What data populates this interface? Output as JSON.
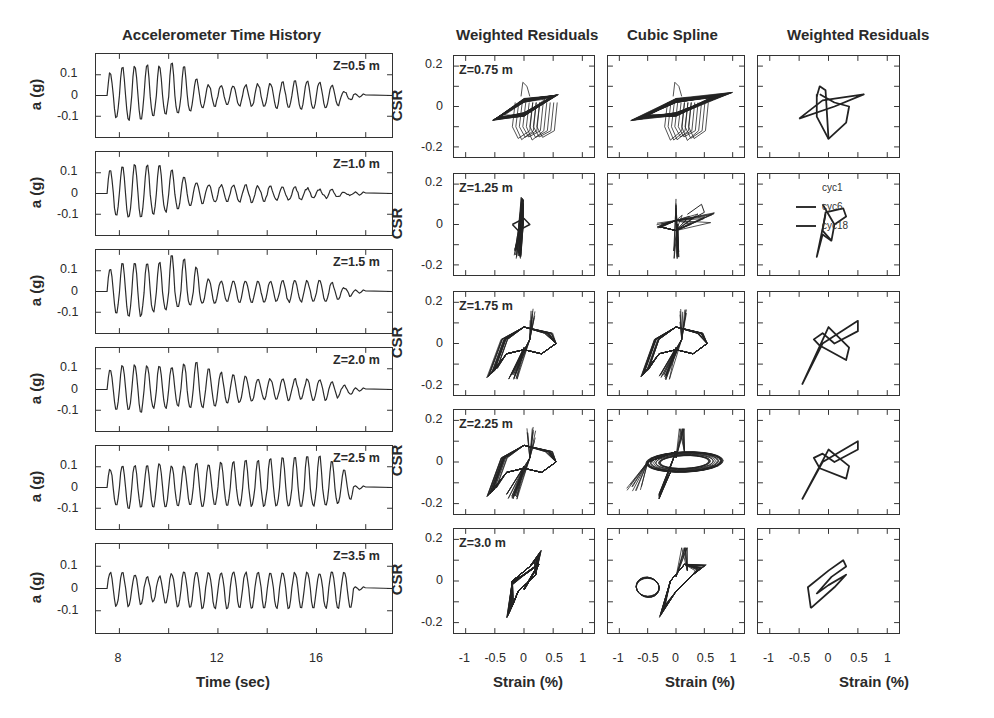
{
  "titles": {
    "accel": "Accelerometer Time History",
    "wr1": "Weighted Residuals",
    "cs": "Cubic Spline",
    "wr2": "Weighted Residuals"
  },
  "axes": {
    "accel_ylabel": "a (g)",
    "accel_xlabel": "Time (sec)",
    "accel_yticks": [
      "0.1",
      "0",
      "-0.1"
    ],
    "accel_xticks": [
      "8",
      "12",
      "16"
    ],
    "csr_ylabel": "CSR",
    "csr_yticks": [
      "0.2",
      "0",
      "-0.2"
    ],
    "csr_xlabel": "Strain (%)",
    "csr_xticks": [
      "-1",
      "-0.5",
      "0",
      "0.5",
      "1"
    ]
  },
  "accel_depths": [
    "Z=0.5 m",
    "Z=1.0 m",
    "Z=1.5 m",
    "Z=2.0 m",
    "Z=2.5 m",
    "Z=3.5 m"
  ],
  "csr_depths": [
    "Z=0.75 m",
    "Z=1.25 m",
    "Z=1.75 m",
    "Z=2.25 m",
    "Z=3.0 m"
  ],
  "legend": {
    "items": [
      "cyc1",
      "cyc6",
      "cyc18"
    ]
  },
  "chart_data": [
    {
      "type": "line",
      "title": "Accelerometer Time History",
      "xlabel": "Time (sec)",
      "ylabel": "a (g)",
      "xlim": [
        6,
        18
      ],
      "ylim": [
        -0.2,
        0.2
      ],
      "xticks": [
        8,
        12,
        16
      ],
      "yticks": [
        -0.1,
        0,
        0.1
      ],
      "series": [
        {
          "name": "Z=0.5 m",
          "description": "shaking ~7.5-18 s, peaks ~0.12 g early decaying to ~0.05 g, spikes to -0.17 g near 10-11 s"
        },
        {
          "name": "Z=1.0 m",
          "description": "peaks ~0.12 g early, decaying to ~0.03 g after 13 s, min ~-0.15 g"
        },
        {
          "name": "Z=1.5 m",
          "description": "peaks ~0.12 g, spikes to -0.18 g near 10.5-11.5 s, then ~0.05 g cycles"
        },
        {
          "name": "Z=2.0 m",
          "description": "peaks ~0.1 g, min ~-0.12 g, noisy mid-section 10-13 s"
        },
        {
          "name": "Z=2.5 m",
          "description": "peaks ~0.1 g, spikes to -0.15 g near 15-17 s"
        },
        {
          "name": "Z=3.5 m",
          "description": "uniform cycles ~+0.09/-0.07 g from 7.5 to 17.5 s"
        }
      ]
    },
    {
      "type": "line",
      "title": "Weighted Residuals",
      "xlabel": "Strain (%)",
      "ylabel": "CSR",
      "xlim": [
        -1.2,
        1.2
      ],
      "ylim": [
        -0.25,
        0.25
      ],
      "xticks": [
        -1,
        -0.5,
        0,
        0.5,
        1
      ],
      "yticks": [
        -0.2,
        0,
        0.2
      ],
      "series": [
        {
          "name": "Z=0.75 m",
          "description": "hysteresis loops, strain -0.5 to 0.6, CSR -0.17 to 0.1"
        },
        {
          "name": "Z=1.25 m",
          "description": "narrow loops, strain -0.2 to 0.1, CSR -0.17 to 0.12"
        },
        {
          "name": "Z=1.75 m",
          "description": "loops strain -0.7 to 0.6, CSR -0.2 to 0.17"
        },
        {
          "name": "Z=2.25 m",
          "description": "loops strain -0.7 to 0.6, CSR -0.2 to 0.17"
        },
        {
          "name": "Z=3.0 m",
          "description": "loops strain -0.35 to 0.35, CSR -0.19 to 0.17"
        }
      ]
    },
    {
      "type": "line",
      "title": "Cubic Spline",
      "xlabel": "Strain (%)",
      "ylabel": "CSR",
      "xlim": [
        -1.2,
        1.2
      ],
      "ylim": [
        -0.25,
        0.25
      ],
      "xticks": [
        -1,
        -0.5,
        0,
        0.5,
        1
      ],
      "yticks": [
        -0.2,
        0,
        0.2
      ],
      "series": [
        {
          "name": "Z=0.75 m",
          "description": "loops strain -0.75 to 1.0, CSR -0.17 to 0.12"
        },
        {
          "name": "Z=1.25 m",
          "description": "loops strain -0.3 to 0.6, CSR -0.17 to 0.15"
        },
        {
          "name": "Z=1.75 m",
          "description": "loops strain -0.7 to 0.5, CSR -0.2 to 0.17"
        },
        {
          "name": "Z=2.25 m",
          "description": "loops strain -0.9 to 0.9, CSR -0.2 to 0.17"
        },
        {
          "name": "Z=3.0 m",
          "description": "loops strain -0.5 to 0.6, CSR -0.19 to 0.17"
        }
      ]
    },
    {
      "type": "line",
      "title": "Weighted Residuals",
      "xlabel": "Strain (%)",
      "ylabel": "CSR",
      "xlim": [
        -1.2,
        1.2
      ],
      "ylim": [
        -0.25,
        0.25
      ],
      "xticks": [
        -1,
        -0.5,
        0,
        0.5,
        1
      ],
      "yticks": [
        -0.2,
        0,
        0.2
      ],
      "legend": [
        "cyc1",
        "cyc6",
        "cyc18"
      ],
      "series": [
        {
          "name": "Z=0.75 m",
          "description": "selected cycles, strain -0.5 to 0.6, CSR -0.16 to 0.08"
        },
        {
          "name": "Z=1.25 m",
          "description": "selected cycles, strain -0.2 to 0.3, CSR -0.16 to 0.1"
        },
        {
          "name": "Z=1.75 m",
          "description": "selected cycles, strain -0.5 to 0.5, CSR -0.2 to 0.1"
        },
        {
          "name": "Z=2.25 m",
          "description": "selected cycles, strain -0.5 to 0.5, CSR -0.18 to 0.1"
        },
        {
          "name": "Z=3.0 m",
          "description": "selected cycles, strain -0.35 to 0.3, CSR -0.14 to 0.1"
        }
      ]
    }
  ]
}
